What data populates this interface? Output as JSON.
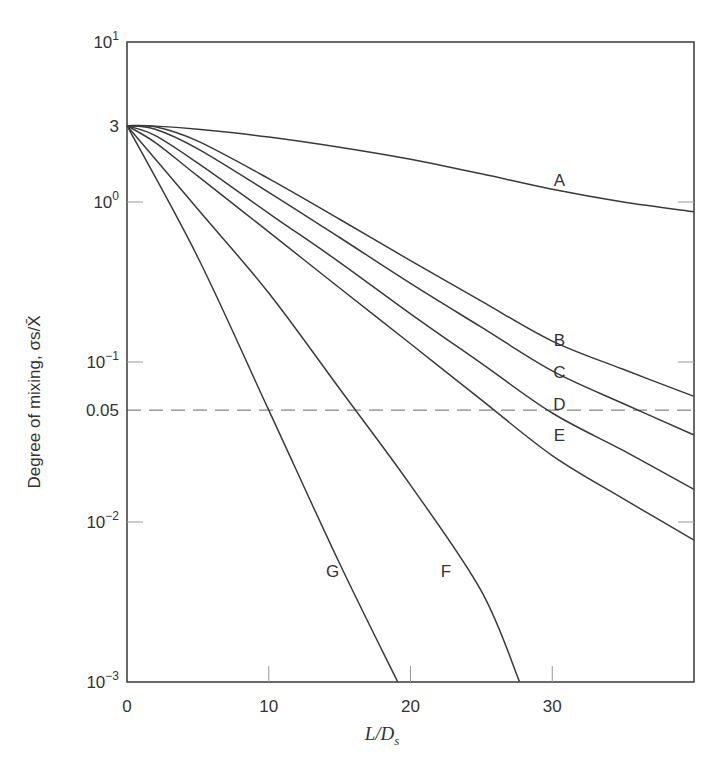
{
  "chart_data": {
    "type": "line",
    "title": "",
    "xlabel": "L/D_s",
    "ylabel": "Degree of mixing, σs/X̄",
    "xscale": "linear",
    "yscale": "log",
    "xlim": [
      0,
      40
    ],
    "ylim": [
      0.001,
      10
    ],
    "grid": false,
    "x_ticks": [
      0,
      10,
      20,
      30
    ],
    "x_tick_labels": [
      "0",
      "10",
      "20",
      "30"
    ],
    "y_ticks": [
      10,
      3,
      1,
      0.1,
      0.05,
      0.01,
      0.001
    ],
    "y_tick_labels": [
      "10^1",
      "3",
      "10^0",
      "10^-1",
      "0.05",
      "10^-2",
      "10^-3"
    ],
    "reference_line": {
      "y": 0.05,
      "style": "dashed",
      "label": "0.05"
    },
    "series": [
      {
        "name": "A",
        "x": [
          0,
          2,
          5,
          10,
          15,
          20,
          25,
          30,
          35,
          40
        ],
        "y": [
          3,
          2.98,
          2.85,
          2.55,
          2.2,
          1.85,
          1.5,
          1.2,
          1.0,
          0.87
        ]
      },
      {
        "name": "B",
        "x": [
          0,
          2,
          5,
          10,
          15,
          20,
          25,
          30,
          35,
          40
        ],
        "y": [
          3,
          2.95,
          2.4,
          1.4,
          0.78,
          0.43,
          0.24,
          0.135,
          0.09,
          0.061
        ]
      },
      {
        "name": "C",
        "x": [
          0,
          2,
          5,
          10,
          15,
          20,
          25,
          30,
          35,
          40
        ],
        "y": [
          3,
          2.85,
          2.15,
          1.15,
          0.6,
          0.31,
          0.165,
          0.088,
          0.055,
          0.035
        ]
      },
      {
        "name": "D",
        "x": [
          0,
          2,
          5,
          10,
          15,
          20,
          25,
          30,
          35,
          40
        ],
        "y": [
          3,
          2.6,
          1.75,
          0.85,
          0.42,
          0.2,
          0.098,
          0.048,
          0.028,
          0.016
        ]
      },
      {
        "name": "E",
        "x": [
          0,
          2,
          5,
          10,
          15,
          20,
          25,
          30,
          35,
          40
        ],
        "y": [
          3,
          2.35,
          1.45,
          0.65,
          0.29,
          0.13,
          0.058,
          0.026,
          0.014,
          0.0077
        ]
      },
      {
        "name": "F",
        "x": [
          0,
          5,
          10,
          15,
          20,
          25,
          27.7
        ],
        "y": [
          3,
          0.9,
          0.27,
          0.068,
          0.017,
          0.0037,
          0.001
        ]
      },
      {
        "name": "G",
        "x": [
          0,
          5,
          10,
          15,
          19.1
        ],
        "y": [
          3,
          0.45,
          0.05,
          0.0055,
          0.001
        ]
      }
    ],
    "curve_labels": [
      {
        "name": "A",
        "x": 30.5,
        "y": 1.25
      },
      {
        "name": "B",
        "x": 30.5,
        "y": 0.125
      },
      {
        "name": "C",
        "x": 30.5,
        "y": 0.08
      },
      {
        "name": "D",
        "x": 30.5,
        "y": 0.05
      },
      {
        "name": "E",
        "x": 30.5,
        "y": 0.032
      },
      {
        "name": "F",
        "x": 22.5,
        "y": 0.0045
      },
      {
        "name": "G",
        "x": 14.5,
        "y": 0.0045
      }
    ]
  },
  "labels": {
    "ylabel_text": "Degree of mixing, σs/X̄",
    "xlabel_L": "L/D",
    "xlabel_sub": "s"
  }
}
